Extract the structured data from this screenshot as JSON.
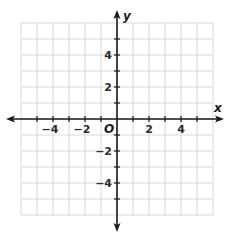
{
  "chart_data": {
    "type": "scatter",
    "title": "",
    "xlabel": "x",
    "ylabel": "y",
    "origin_label": "O",
    "xlim": [
      -6,
      6
    ],
    "ylim": [
      -6,
      6
    ],
    "grid": true,
    "grid_step": 1,
    "x_ticks": [
      -4,
      -2,
      2,
      4
    ],
    "y_ticks": [
      4,
      2,
      -2,
      -4
    ],
    "x_tick_labels": [
      "−4",
      "−2",
      "2",
      "4"
    ],
    "y_tick_labels": [
      "4",
      "2",
      "−2",
      "−4"
    ],
    "series": [],
    "legend": null
  },
  "colors": {
    "grid": "#d9d9d9",
    "axis": "#1a1a1a",
    "background": "#ffffff"
  }
}
